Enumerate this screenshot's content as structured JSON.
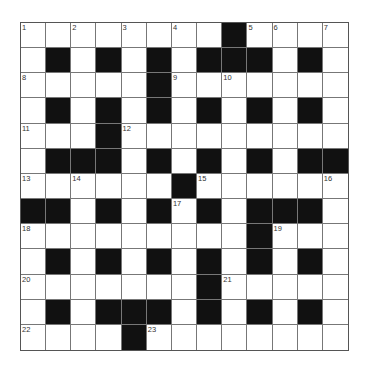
{
  "puzzle": {
    "rows": 13,
    "cols": 13,
    "colors": {
      "block": "#111111",
      "cell": "#ffffff",
      "grid_line": "#777777",
      "number": "#333333"
    },
    "grid": [
      "...........#.......",
      ""
    ],
    "layout": [
      [
        ".",
        ".",
        ".",
        ".",
        ".",
        ".",
        ".",
        ".",
        "#",
        ".",
        ".",
        ".",
        "."
      ],
      [
        ".",
        "#",
        ".",
        "#",
        ".",
        "#",
        ".",
        "#",
        "#",
        "#",
        ".",
        "#",
        "."
      ],
      [
        ".",
        ".",
        ".",
        ".",
        ".",
        "#",
        ".",
        ".",
        ".",
        ".",
        ".",
        ".",
        "."
      ],
      [
        ".",
        "#",
        ".",
        "#",
        ".",
        "#",
        ".",
        "#",
        ".",
        "#",
        ".",
        "#",
        "."
      ],
      [
        ".",
        ".",
        ".",
        "#",
        ".",
        ".",
        ".",
        ".",
        ".",
        ".",
        ".",
        ".",
        "."
      ],
      [
        ".",
        "#",
        "#",
        "#",
        ".",
        "#",
        ".",
        "#",
        ".",
        "#",
        ".",
        "#",
        "#"
      ],
      [
        ".",
        ".",
        ".",
        ".",
        ".",
        ".",
        "#",
        ".",
        ".",
        ".",
        ".",
        ".",
        "."
      ],
      [
        "#",
        "#",
        ".",
        "#",
        ".",
        "#",
        ".",
        "#",
        ".",
        "#",
        "#",
        "#",
        "."
      ],
      [
        ".",
        ".",
        ".",
        ".",
        ".",
        ".",
        ".",
        ".",
        ".",
        "#",
        ".",
        ".",
        "."
      ],
      [
        ".",
        "#",
        ".",
        "#",
        ".",
        "#",
        ".",
        "#",
        ".",
        "#",
        ".",
        "#",
        "."
      ],
      [
        ".",
        ".",
        ".",
        ".",
        ".",
        ".",
        ".",
        "#",
        ".",
        ".",
        ".",
        ".",
        "."
      ],
      [
        ".",
        "#",
        ".",
        "#",
        "#",
        "#",
        ".",
        "#",
        ".",
        "#",
        ".",
        "#",
        "."
      ],
      [
        ".",
        ".",
        ".",
        ".",
        "#",
        ".",
        ".",
        ".",
        ".",
        ".",
        ".",
        ".",
        "."
      ]
    ],
    "numbers": [
      {
        "row": 0,
        "col": 0,
        "n": "1"
      },
      {
        "row": 0,
        "col": 2,
        "n": "2"
      },
      {
        "row": 0,
        "col": 4,
        "n": "3"
      },
      {
        "row": 0,
        "col": 6,
        "n": "4"
      },
      {
        "row": 0,
        "col": 9,
        "n": "5"
      },
      {
        "row": 0,
        "col": 10,
        "n": "6"
      },
      {
        "row": 0,
        "col": 12,
        "n": "7"
      },
      {
        "row": 2,
        "col": 0,
        "n": "8"
      },
      {
        "row": 2,
        "col": 6,
        "n": "9"
      },
      {
        "row": 2,
        "col": 8,
        "n": "10"
      },
      {
        "row": 4,
        "col": 0,
        "n": "11"
      },
      {
        "row": 4,
        "col": 4,
        "n": "12"
      },
      {
        "row": 6,
        "col": 0,
        "n": "13"
      },
      {
        "row": 6,
        "col": 2,
        "n": "14"
      },
      {
        "row": 6,
        "col": 7,
        "n": "15"
      },
      {
        "row": 6,
        "col": 12,
        "n": "16"
      },
      {
        "row": 7,
        "col": 6,
        "n": "17"
      },
      {
        "row": 8,
        "col": 0,
        "n": "18"
      },
      {
        "row": 8,
        "col": 10,
        "n": "19"
      },
      {
        "row": 10,
        "col": 0,
        "n": "20"
      },
      {
        "row": 10,
        "col": 8,
        "n": "21"
      },
      {
        "row": 12,
        "col": 0,
        "n": "22"
      },
      {
        "row": 12,
        "col": 5,
        "n": "23"
      }
    ]
  }
}
